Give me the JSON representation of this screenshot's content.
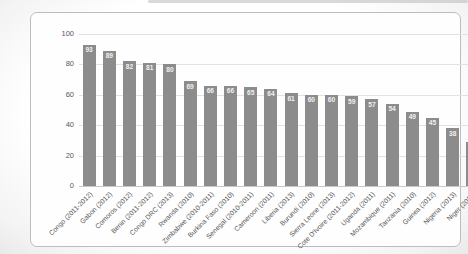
{
  "chart_data": {
    "type": "bar",
    "title": "",
    "xlabel": "",
    "ylabel": "",
    "ylim": [
      0,
      100
    ],
    "yticks": [
      0,
      20,
      40,
      60,
      80,
      100
    ],
    "grid": true,
    "legend": false,
    "bar_color": "#8c8c8c",
    "value_label_color": "#f2f2f2",
    "axis_text_color": "#595959",
    "categories": [
      "Congo (2011-2012)",
      "Gabon (2012)",
      "Comoros (2012)",
      "Benin (2011-2012)",
      "Congo DRC (2013)",
      "Rwanda (2010)",
      "Zimbabwe (2010-2011)",
      "Burkina Faso (2010)",
      "Senegal (2010-2011)",
      "Cameroon (2011)",
      "Liberia (2013)",
      "Burundi (2010)",
      "Sierra Leone (2013)",
      "Cote D'Ivoire (2011-2012)",
      "Uganda (2011)",
      "Mozambique (2011)",
      "Tanzania (2010)",
      "Guinea (2012)",
      "Nigeria (2013)",
      "Niger (2012)"
    ],
    "values": [
      93,
      89,
      82,
      81,
      80,
      69,
      66,
      66,
      65,
      64,
      61,
      60,
      60,
      59,
      57,
      54,
      49,
      45,
      38,
      29
    ]
  }
}
